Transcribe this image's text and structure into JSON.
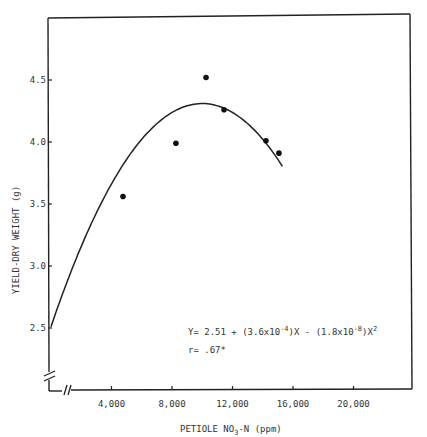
{
  "chart_data": {
    "type": "scatter",
    "title": "",
    "xlabel": "PETIOLE NO3-N (ppm)",
    "xlabel_parts": {
      "pre": "PETIOLE NO",
      "sub": "3",
      "post": "-N (ppm)"
    },
    "ylabel": "YIELD-DRY WEIGHT (g)",
    "x_ticks": [
      4000,
      8000,
      12000,
      16000,
      20000
    ],
    "x_tick_labels": [
      "4,000",
      "8,000",
      "12,000",
      "16,000",
      "20,000"
    ],
    "y_ticks": [
      2.5,
      3.0,
      3.5,
      4.0,
      4.5
    ],
    "y_tick_labels": [
      "2.5",
      "3.0",
      "3.5",
      "4.0",
      "4.5"
    ],
    "xlim": [
      0,
      24000
    ],
    "ylim": [
      2.1,
      5.0
    ],
    "axis_breaks": {
      "x": true,
      "y": true
    },
    "grid": false,
    "series": [
      {
        "name": "observed",
        "kind": "scatter",
        "points": [
          {
            "x": 4760,
            "y": 3.56
          },
          {
            "x": 8260,
            "y": 3.99
          },
          {
            "x": 10250,
            "y": 4.52
          },
          {
            "x": 11440,
            "y": 4.26
          },
          {
            "x": 14210,
            "y": 4.01
          },
          {
            "x": 15070,
            "y": 3.91
          }
        ]
      },
      {
        "name": "fitted quadratic",
        "kind": "line",
        "equation": {
          "a": 2.51,
          "b": 0.00036,
          "c": -1.8e-08
        },
        "x_range": [
          0,
          15300
        ]
      }
    ],
    "annotations": [
      {
        "text": "Y= 2.51 + (3.6x10^-4)X - (1.8x10^-8)X^2"
      },
      {
        "text": "r= .67*"
      }
    ]
  },
  "labels": {
    "xlabel_pre": "PETIOLE NO",
    "xlabel_sub": "3",
    "xlabel_post": "-N (ppm)",
    "ylabel": "YIELD-DRY WEIGHT (g)",
    "eq_part1": "Y= 2.51 + (3.6x10",
    "eq_exp1": "-4",
    "eq_part2": ")X - (1.8x10",
    "eq_exp2": "-8",
    "eq_part3": ")X",
    "eq_exp3": "2",
    "r_label": "r= .67*"
  }
}
